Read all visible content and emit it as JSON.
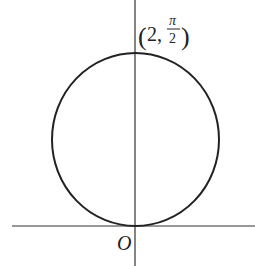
{
  "diagram": {
    "type": "polar-circle",
    "colors": {
      "stroke": "#222222",
      "axis": "#333333",
      "background": "#ffffff"
    },
    "labels": {
      "origin": "O",
      "point_open": "(",
      "point_r": "2,",
      "point_theta_num": "π",
      "point_theta_den": "2",
      "point_close": ")"
    },
    "point": {
      "r": "2",
      "theta": "π/2"
    }
  }
}
